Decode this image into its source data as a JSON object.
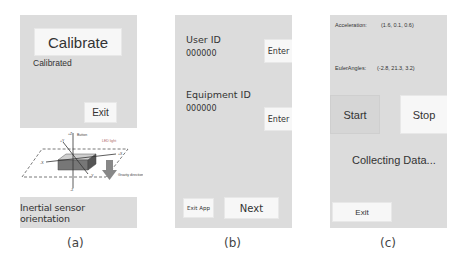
{
  "panels": {
    "a": {
      "calibrate_button": "Calibrate",
      "status": "Calibrated",
      "exit_button": "Exit",
      "diagram": {
        "labels": {
          "button": "Button",
          "led": "LED light",
          "gravity": "Gravity direction",
          "z_pos": "+Z",
          "z_neg": "-Z",
          "x_pos": "+X",
          "x_neg": "-X",
          "y_pos": "+Y",
          "y_neg": "-Y"
        }
      },
      "orientation_caption": "Inertial sensor orientation",
      "figure_label": "(a)"
    },
    "b": {
      "user_id_label": "User ID",
      "user_id_value": "000000",
      "user_enter_button": "Enter",
      "equipment_id_label": "Equipment ID",
      "equipment_id_value": "000000",
      "equipment_enter_button": "Enter",
      "exit_app_button": "Exit App",
      "next_button": "Next",
      "figure_label": "(b)"
    },
    "c": {
      "acceleration_label": "Acceleration:",
      "acceleration_value": "(1.6, 0.1, 0.6)",
      "euler_label": "EulerAngles:",
      "euler_value": "(-2.8, 21.3, 3.2)",
      "start_button": "Start",
      "stop_button": "Stop",
      "status": "Collecting Data...",
      "exit_button": "Exit",
      "figure_label": "(c)"
    }
  },
  "colors": {
    "screen_bg": "#dcdcdc",
    "button_bg": "#f7f7f7",
    "text": "#333333"
  }
}
